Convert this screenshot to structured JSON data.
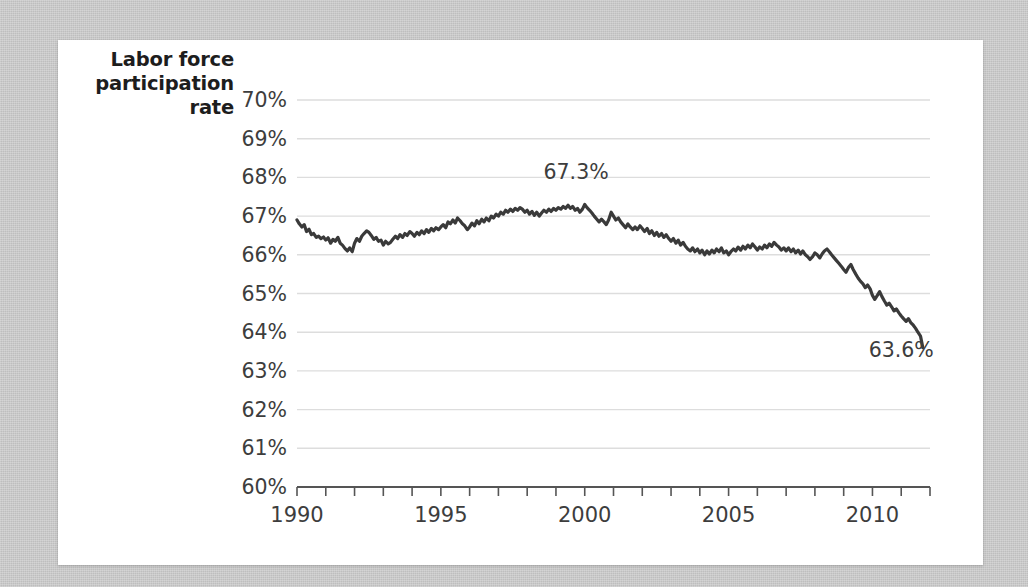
{
  "card": {
    "background_color": "#ffffff"
  },
  "page": {
    "background_color": "#c9c9c9"
  },
  "axis_title": {
    "line1": "Labor force",
    "line2": "participation",
    "line3": "rate"
  },
  "chart_data": {
    "type": "line",
    "title": "",
    "subtitle": "",
    "xlabel": "",
    "ylabel": "Labor force participation rate",
    "xlim": [
      1990,
      2012
    ],
    "ylim": [
      60,
      70
    ],
    "grid": true,
    "legend": "none",
    "line_color": "#3a3a3a",
    "grid_color": "#dddddd",
    "axis_color": "#555555",
    "ytick_labels": [
      "70%",
      "69%",
      "68%",
      "67%",
      "66%",
      "65%",
      "64%",
      "63%",
      "62%",
      "61%",
      "60%"
    ],
    "ytick_values": [
      70,
      69,
      68,
      67,
      66,
      65,
      64,
      63,
      62,
      61,
      60
    ],
    "xtick_labels": [
      "1990",
      "1995",
      "2000",
      "2005",
      "2010"
    ],
    "xtick_values": [
      1990,
      1995,
      2000,
      2005,
      2010
    ],
    "xtick_minor_values": [
      1991,
      1992,
      1993,
      1994,
      1996,
      1997,
      1998,
      1999,
      2001,
      2002,
      2003,
      2004,
      2006,
      2007,
      2008,
      2009,
      2011,
      2012
    ],
    "annotations": [
      {
        "text": "67.3%",
        "x": 1999.7,
        "y": 67.95,
        "anchor": "middle"
      },
      {
        "text": "63.6%",
        "x": 2011.0,
        "y": 63.35,
        "anchor": "middle"
      }
    ],
    "series": [
      {
        "name": "Labor force participation rate",
        "x": [
          1990.0,
          1990.08,
          1990.17,
          1990.25,
          1990.33,
          1990.42,
          1990.5,
          1990.58,
          1990.67,
          1990.75,
          1990.83,
          1990.92,
          1991.0,
          1991.08,
          1991.17,
          1991.25,
          1991.33,
          1991.42,
          1991.5,
          1991.58,
          1991.67,
          1991.75,
          1991.83,
          1991.92,
          1992.0,
          1992.08,
          1992.17,
          1992.25,
          1992.33,
          1992.42,
          1992.5,
          1992.58,
          1992.67,
          1992.75,
          1992.83,
          1992.92,
          1993.0,
          1993.08,
          1993.17,
          1993.25,
          1993.33,
          1993.42,
          1993.5,
          1993.58,
          1993.67,
          1993.75,
          1993.83,
          1993.92,
          1994.0,
          1994.08,
          1994.17,
          1994.25,
          1994.33,
          1994.42,
          1994.5,
          1994.58,
          1994.67,
          1994.75,
          1994.83,
          1994.92,
          1995.0,
          1995.08,
          1995.17,
          1995.25,
          1995.33,
          1995.42,
          1995.5,
          1995.58,
          1995.67,
          1995.75,
          1995.83,
          1995.92,
          1996.0,
          1996.08,
          1996.17,
          1996.25,
          1996.33,
          1996.42,
          1996.5,
          1996.58,
          1996.67,
          1996.75,
          1996.83,
          1996.92,
          1997.0,
          1997.08,
          1997.17,
          1997.25,
          1997.33,
          1997.42,
          1997.5,
          1997.58,
          1997.67,
          1997.75,
          1997.83,
          1997.92,
          1998.0,
          1998.08,
          1998.17,
          1998.25,
          1998.33,
          1998.42,
          1998.5,
          1998.58,
          1998.67,
          1998.75,
          1998.83,
          1998.92,
          1999.0,
          1999.08,
          1999.17,
          1999.25,
          1999.33,
          1999.42,
          1999.5,
          1999.58,
          1999.67,
          1999.75,
          1999.83,
          1999.92,
          2000.0,
          2000.08,
          2000.17,
          2000.25,
          2000.33,
          2000.42,
          2000.5,
          2000.58,
          2000.67,
          2000.75,
          2000.83,
          2000.92,
          2001.0,
          2001.08,
          2001.17,
          2001.25,
          2001.33,
          2001.42,
          2001.5,
          2001.58,
          2001.67,
          2001.75,
          2001.83,
          2001.92,
          2002.0,
          2002.08,
          2002.17,
          2002.25,
          2002.33,
          2002.42,
          2002.5,
          2002.58,
          2002.67,
          2002.75,
          2002.83,
          2002.92,
          2003.0,
          2003.08,
          2003.17,
          2003.25,
          2003.33,
          2003.42,
          2003.5,
          2003.58,
          2003.67,
          2003.75,
          2003.83,
          2003.92,
          2004.0,
          2004.08,
          2004.17,
          2004.25,
          2004.33,
          2004.42,
          2004.5,
          2004.58,
          2004.67,
          2004.75,
          2004.83,
          2004.92,
          2005.0,
          2005.08,
          2005.17,
          2005.25,
          2005.33,
          2005.42,
          2005.5,
          2005.58,
          2005.67,
          2005.75,
          2005.83,
          2005.92,
          2006.0,
          2006.08,
          2006.17,
          2006.25,
          2006.33,
          2006.42,
          2006.5,
          2006.58,
          2006.67,
          2006.75,
          2006.83,
          2006.92,
          2007.0,
          2007.08,
          2007.17,
          2007.25,
          2007.33,
          2007.42,
          2007.5,
          2007.58,
          2007.67,
          2007.75,
          2007.83,
          2007.92,
          2008.0,
          2008.08,
          2008.17,
          2008.25,
          2008.33,
          2008.42,
          2008.5,
          2008.58,
          2008.67,
          2008.75,
          2008.83,
          2008.92,
          2009.0,
          2009.08,
          2009.17,
          2009.25,
          2009.33,
          2009.42,
          2009.5,
          2009.58,
          2009.67,
          2009.75,
          2009.83,
          2009.92,
          2010.0,
          2010.08,
          2010.17,
          2010.25,
          2010.33,
          2010.42,
          2010.5,
          2010.58,
          2010.67,
          2010.75,
          2010.83,
          2010.92,
          2011.0,
          2011.08,
          2011.17,
          2011.25,
          2011.33,
          2011.42,
          2011.5,
          2011.58,
          2011.67,
          2011.75
        ],
        "y": [
          66.9,
          66.8,
          66.72,
          66.78,
          66.6,
          66.66,
          66.52,
          66.55,
          66.45,
          66.48,
          66.42,
          66.46,
          66.38,
          66.44,
          66.3,
          66.4,
          66.35,
          66.45,
          66.3,
          66.25,
          66.16,
          66.1,
          66.18,
          66.08,
          66.3,
          66.42,
          66.35,
          66.48,
          66.55,
          66.62,
          66.58,
          66.5,
          66.4,
          66.45,
          66.35,
          66.38,
          66.25,
          66.35,
          66.28,
          66.32,
          66.4,
          66.48,
          66.42,
          66.52,
          66.45,
          66.55,
          66.5,
          66.6,
          66.55,
          66.48,
          66.58,
          66.52,
          66.62,
          66.55,
          66.65,
          66.58,
          66.68,
          66.62,
          66.7,
          66.65,
          66.72,
          66.78,
          66.7,
          66.85,
          66.8,
          66.9,
          66.82,
          66.95,
          66.88,
          66.8,
          66.75,
          66.65,
          66.72,
          66.82,
          66.75,
          66.88,
          66.8,
          66.92,
          66.85,
          66.95,
          66.88,
          67.0,
          66.95,
          67.05,
          67.0,
          67.1,
          67.05,
          67.15,
          67.1,
          67.18,
          67.12,
          67.2,
          67.15,
          67.22,
          67.18,
          67.1,
          67.15,
          67.05,
          67.12,
          67.02,
          67.1,
          67.0,
          67.08,
          67.15,
          67.1,
          67.18,
          67.12,
          67.2,
          67.15,
          67.22,
          67.18,
          67.25,
          67.2,
          67.28,
          67.2,
          67.25,
          67.15,
          67.2,
          67.1,
          67.18,
          67.3,
          67.22,
          67.15,
          67.08,
          67.0,
          66.92,
          66.85,
          66.92,
          66.85,
          66.78,
          66.9,
          67.1,
          67.0,
          66.9,
          66.95,
          66.85,
          66.78,
          66.7,
          66.8,
          66.72,
          66.65,
          66.72,
          66.65,
          66.75,
          66.68,
          66.6,
          66.68,
          66.55,
          66.62,
          66.5,
          66.58,
          66.48,
          66.55,
          66.45,
          66.52,
          66.42,
          66.35,
          66.42,
          66.3,
          66.38,
          66.25,
          66.32,
          66.22,
          66.15,
          66.1,
          66.18,
          66.08,
          66.15,
          66.05,
          66.12,
          66.0,
          66.1,
          66.02,
          66.12,
          66.05,
          66.15,
          66.08,
          66.18,
          66.05,
          66.1,
          66.0,
          66.08,
          66.15,
          66.1,
          66.2,
          66.12,
          66.22,
          66.15,
          66.25,
          66.18,
          66.28,
          66.2,
          66.12,
          66.2,
          66.15,
          66.25,
          66.18,
          66.28,
          66.22,
          66.32,
          66.25,
          66.2,
          66.12,
          66.18,
          66.1,
          66.18,
          66.08,
          66.15,
          66.05,
          66.12,
          66.02,
          66.1,
          66.0,
          65.95,
          65.88,
          65.95,
          66.05,
          66.0,
          65.92,
          66.02,
          66.1,
          66.15,
          66.08,
          66.0,
          65.92,
          65.85,
          65.78,
          65.7,
          65.62,
          65.55,
          65.68,
          65.75,
          65.62,
          65.5,
          65.4,
          65.32,
          65.25,
          65.15,
          65.22,
          65.12,
          64.95,
          64.85,
          64.95,
          65.05,
          64.92,
          64.8,
          64.7,
          64.75,
          64.65,
          64.55,
          64.6,
          64.5,
          64.42,
          64.35,
          64.28,
          64.35,
          64.25,
          64.18,
          64.1,
          64.0,
          63.9,
          63.6
        ]
      }
    ]
  }
}
